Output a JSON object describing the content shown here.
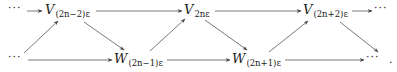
{
  "diagram": {
    "type": "commutative-diagram",
    "top_row": [
      {
        "id": "dots-top-left",
        "label": "···"
      },
      {
        "id": "V1",
        "main": "V",
        "sub": "(2n−2)ε"
      },
      {
        "id": "V2",
        "main": "V",
        "sub": "2nε"
      },
      {
        "id": "V3",
        "main": "V",
        "sub": "(2n+2)ε"
      },
      {
        "id": "dots-top-right",
        "label": "···"
      }
    ],
    "bottom_row": [
      {
        "id": "dots-bottom-left",
        "label": "···"
      },
      {
        "id": "W1",
        "main": "W",
        "sub": "(2n−1)ε"
      },
      {
        "id": "W2",
        "main": "W",
        "sub": "(2n+1)ε"
      },
      {
        "id": "dots-bottom-right",
        "label": "···"
      },
      {
        "id": "period",
        "label": "."
      }
    ],
    "edges": [
      [
        "dots-top-left",
        "V1"
      ],
      [
        "V1",
        "V2"
      ],
      [
        "V2",
        "V3"
      ],
      [
        "V3",
        "dots-top-right"
      ],
      [
        "dots-bottom-left",
        "W1"
      ],
      [
        "W1",
        "W2"
      ],
      [
        "W2",
        "dots-bottom-right"
      ],
      [
        "dots-bottom-left",
        "V1"
      ],
      [
        "V1",
        "W1"
      ],
      [
        "W1",
        "V2"
      ],
      [
        "V2",
        "W2"
      ],
      [
        "W2",
        "V3"
      ],
      [
        "V3",
        "dots-bottom-right"
      ]
    ]
  }
}
